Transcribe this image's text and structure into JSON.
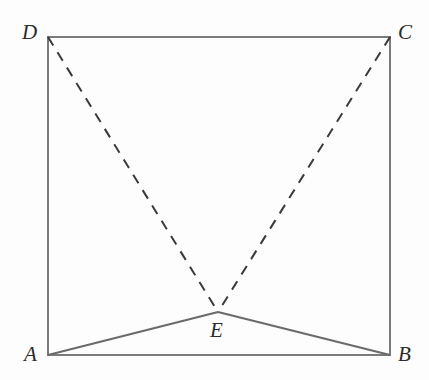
{
  "figure": {
    "type": "geometry-diagram",
    "background_color": "#fdfdfd",
    "square_stroke_color": "#7a7a7a",
    "solid_segment_color": "#6a6a6a",
    "dashed_segment_color": "#3a3a3a",
    "square_stroke_width": 2,
    "solid_segment_width": 2,
    "dashed_segment_width": 2,
    "dash_pattern": "10 8",
    "points": [
      {
        "id": "A",
        "label": "A",
        "x": 48,
        "y": 355,
        "label_x": 24,
        "label_y": 344
      },
      {
        "id": "B",
        "label": "B",
        "x": 390,
        "y": 355,
        "label_x": 398,
        "label_y": 344
      },
      {
        "id": "C",
        "label": "C",
        "x": 390,
        "y": 37,
        "label_x": 398,
        "label_y": 22
      },
      {
        "id": "D",
        "label": "D",
        "x": 48,
        "y": 37,
        "label_x": 22,
        "label_y": 22
      },
      {
        "id": "E",
        "label": "E",
        "x": 218,
        "y": 312,
        "label_x": 210,
        "label_y": 320
      }
    ],
    "square_outline": {
      "name": "square-ABCD",
      "vertices": "A,B,C,D",
      "path": "M 48 355 L 48 37 L 390 37 L 390 355 Z"
    },
    "segments": [
      {
        "name": "segment-DE",
        "from": "D",
        "to": "E",
        "style": "dashed",
        "path": "M 48 37 L 218 312"
      },
      {
        "name": "segment-CE",
        "from": "C",
        "to": "E",
        "style": "dashed",
        "path": "M 390 37 L 218 312"
      },
      {
        "name": "segment-AE",
        "from": "A",
        "to": "E",
        "style": "solid",
        "path": "M 48 355 L 218 312"
      },
      {
        "name": "segment-EB",
        "from": "E",
        "to": "B",
        "style": "solid",
        "path": "M 218 312 L 390 355"
      }
    ]
  }
}
